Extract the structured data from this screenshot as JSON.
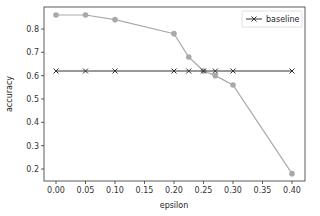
{
  "chart_data": {
    "type": "line",
    "title": "",
    "xlabel": "epsilon",
    "ylabel": "accuracy",
    "xlim": [
      -0.02,
      0.42
    ],
    "ylim": [
      0.14,
      0.89
    ],
    "xticks": [
      "0.00",
      "0.05",
      "0.10",
      "0.15",
      "0.20",
      "0.25",
      "0.30",
      "0.35",
      "0.40"
    ],
    "yticks": [
      "0.2",
      "0.3",
      "0.4",
      "0.5",
      "0.6",
      "0.7",
      "0.8"
    ],
    "grid": false,
    "legend_position": "upper right",
    "series": [
      {
        "name": "",
        "color": "#a9a9a9",
        "marker": "circle",
        "x": [
          0.0,
          0.05,
          0.1,
          0.2,
          0.225,
          0.25,
          0.27,
          0.3,
          0.4
        ],
        "y": [
          0.86,
          0.86,
          0.84,
          0.78,
          0.68,
          0.62,
          0.6,
          0.56,
          0.18
        ]
      },
      {
        "name": "baseline",
        "color": "#333333",
        "marker": "x",
        "x": [
          0.0,
          0.05,
          0.1,
          0.2,
          0.225,
          0.25,
          0.27,
          0.3,
          0.4
        ],
        "y": [
          0.62,
          0.62,
          0.62,
          0.62,
          0.62,
          0.62,
          0.62,
          0.62,
          0.62
        ]
      }
    ]
  },
  "legend": {
    "label": "baseline"
  }
}
